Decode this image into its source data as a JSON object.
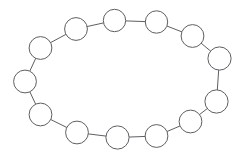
{
  "canvas": {
    "width": 248,
    "height": 160,
    "background_color": "#ffffff"
  },
  "diagram": {
    "node_count": 14,
    "edge_count": 14,
    "style": {
      "node_fill": "#ffffff",
      "node_stroke": "#5f5f63",
      "node_stroke_width": 1,
      "edge_stroke": "#5f5f63",
      "edge_stroke_width": 1,
      "node_radius": 11.2
    }
  },
  "chart_data": {
    "type": "scatter",
    "title": "",
    "xlabel": "",
    "ylabel": "",
    "xlim": [
      0,
      248
    ],
    "ylim": [
      0,
      160
    ],
    "grid": false,
    "legend": null,
    "nodes": [
      {
        "id": 0,
        "label": "",
        "x": 114.5,
        "y": 20.5,
        "r": 11.2
      },
      {
        "id": 1,
        "label": "",
        "x": 156.5,
        "y": 22.0,
        "r": 11.2
      },
      {
        "id": 2,
        "label": "",
        "x": 192.5,
        "y": 36.0,
        "r": 11.4
      },
      {
        "id": 3,
        "label": "",
        "x": 219.5,
        "y": 58.5,
        "r": 11.6
      },
      {
        "id": 4,
        "label": "",
        "x": 216.5,
        "y": 101.5,
        "r": 11.6
      },
      {
        "id": 5,
        "label": "",
        "x": 190.5,
        "y": 121.5,
        "r": 11.4
      },
      {
        "id": 6,
        "label": "",
        "x": 156.5,
        "y": 136.0,
        "r": 11.4
      },
      {
        "id": 7,
        "label": "",
        "x": 117.5,
        "y": 137.5,
        "r": 11.6
      },
      {
        "id": 8,
        "label": "",
        "x": 77.0,
        "y": 132.5,
        "r": 11.4
      },
      {
        "id": 9,
        "label": "",
        "x": 40.5,
        "y": 114.5,
        "r": 11.4
      },
      {
        "id": 10,
        "label": "",
        "x": 25.0,
        "y": 81.5,
        "r": 11.4
      },
      {
        "id": 11,
        "label": "",
        "x": 40.5,
        "y": 48.0,
        "r": 11.4
      },
      {
        "id": 12,
        "label": "",
        "x": 76.0,
        "y": 29.0,
        "r": 11.4
      },
      {
        "id": 13,
        "label": "",
        "x": 114.5,
        "y": 20.5,
        "r": 11.2
      }
    ],
    "edges": [
      {
        "from": 0,
        "to": 1
      },
      {
        "from": 1,
        "to": 2
      },
      {
        "from": 2,
        "to": 3
      },
      {
        "from": 3,
        "to": 4
      },
      {
        "from": 4,
        "to": 5
      },
      {
        "from": 5,
        "to": 6
      },
      {
        "from": 6,
        "to": 7
      },
      {
        "from": 7,
        "to": 8
      },
      {
        "from": 8,
        "to": 9
      },
      {
        "from": 9,
        "to": 10
      },
      {
        "from": 10,
        "to": 11
      },
      {
        "from": 11,
        "to": 12
      },
      {
        "from": 12,
        "to": 0
      }
    ]
  }
}
